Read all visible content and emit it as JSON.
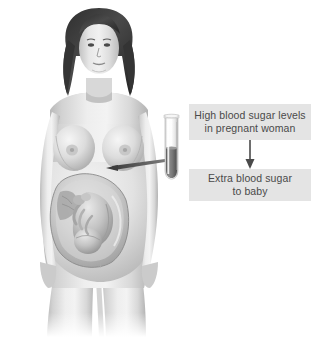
{
  "illustration": {
    "title": "Gestational diabetes illustration",
    "subject": "pregnant-woman-with-fetus",
    "style": "grayscale medical illustration",
    "background_color": "#ffffff",
    "parts": {
      "woman_label": "pregnant woman figure",
      "uterus_label": "uterus cutaway with fetus",
      "fetus_label": "fetus in head-down position",
      "tube_label": "blood sample test tube",
      "pointer_label": "leader line from test tube to uterus"
    }
  },
  "callouts": {
    "top": {
      "text": "High blood sugar levels\nin pregnant woman",
      "background_color": "#e4e4e4",
      "text_color": "#4a4a4a"
    },
    "bottom": {
      "text": "Extra blood sugar\nto baby",
      "background_color": "#e4e4e4",
      "text_color": "#4a4a4a"
    },
    "arrow": {
      "direction": "down",
      "color": "#4a4a4a"
    }
  },
  "tube": {
    "liquid_color": "#6e6e6e",
    "glass_color": "#f2f2f2"
  }
}
